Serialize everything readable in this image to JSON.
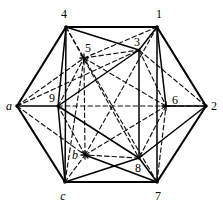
{
  "figure": {
    "background_color": "#ffffff",
    "line_color": "#000000",
    "outer_edge_width": 2.0,
    "inner_edge_width": 1.4,
    "hidden_edge_width": 1.2,
    "hidden_dash_pattern": "5,3"
  },
  "vertices": {
    "outer": [
      {
        "id": "4",
        "label": "4",
        "italic": false,
        "x": 66,
        "y": 27,
        "label_x": 64,
        "label_y": 14
      },
      {
        "id": "1",
        "label": "1",
        "italic": false,
        "x": 157,
        "y": 27,
        "label_x": 159,
        "label_y": 14
      },
      {
        "id": "2",
        "label": "2",
        "italic": false,
        "x": 206,
        "y": 106,
        "label_x": 214,
        "label_y": 106
      },
      {
        "id": "7",
        "label": "7",
        "italic": false,
        "x": 157,
        "y": 182,
        "label_x": 158,
        "label_y": 196
      },
      {
        "id": "c",
        "label": "c",
        "italic": true,
        "x": 65,
        "y": 182,
        "label_x": 63,
        "label_y": 196
      },
      {
        "id": "a",
        "label": "a",
        "italic": true,
        "x": 17,
        "y": 106,
        "label_x": 9,
        "label_y": 106
      }
    ],
    "inner": [
      {
        "id": "5",
        "label": "5",
        "italic": false,
        "x": 84,
        "y": 58,
        "label_x": 87,
        "label_y": 50,
        "marker": "cross"
      },
      {
        "id": "3",
        "label": "3",
        "italic": false,
        "x": 139,
        "y": 50,
        "label_x": 137,
        "label_y": 43,
        "marker": "none"
      },
      {
        "id": "6",
        "label": "6",
        "italic": false,
        "x": 166,
        "y": 106,
        "label_x": 174,
        "label_y": 100,
        "marker": "cross"
      },
      {
        "id": "8",
        "label": "8",
        "italic": false,
        "x": 139,
        "y": 158,
        "label_x": 137,
        "label_y": 167,
        "marker": "none"
      },
      {
        "id": "b",
        "label": "b",
        "italic": true,
        "x": 85,
        "y": 155,
        "label_x": 76,
        "label_y": 155,
        "marker": "cross"
      },
      {
        "id": "9",
        "label": "9",
        "italic": false,
        "x": 58,
        "y": 106,
        "label_x": 52,
        "label_y": 99,
        "marker": "none"
      }
    ]
  },
  "edges": {
    "outer_hexagon": [
      {
        "from": "4",
        "to": "1",
        "style": "solid"
      },
      {
        "from": "1",
        "to": "2",
        "style": "solid"
      },
      {
        "from": "2",
        "to": "7",
        "style": "solid"
      },
      {
        "from": "7",
        "to": "c",
        "style": "solid"
      },
      {
        "from": "c",
        "to": "a",
        "style": "solid"
      },
      {
        "from": "a",
        "to": "4",
        "style": "solid"
      }
    ],
    "inner_hexagon": [
      {
        "from": "5",
        "to": "3",
        "style": "dashed"
      },
      {
        "from": "3",
        "to": "6",
        "style": "dashed"
      },
      {
        "from": "6",
        "to": "8",
        "style": "dashed"
      },
      {
        "from": "8",
        "to": "b",
        "style": "dashed"
      },
      {
        "from": "b",
        "to": "9",
        "style": "dashed"
      },
      {
        "from": "9",
        "to": "5",
        "style": "dashed"
      }
    ],
    "triangle_solid_1": [
      {
        "from": "3",
        "to": "9",
        "style": "solid"
      },
      {
        "from": "9",
        "to": "8",
        "style": "solid"
      },
      {
        "from": "8",
        "to": "3",
        "style": "solid"
      }
    ],
    "triangle_dashed_1": [
      {
        "from": "5",
        "to": "6",
        "style": "dashed"
      },
      {
        "from": "6",
        "to": "b",
        "style": "dashed"
      },
      {
        "from": "b",
        "to": "5",
        "style": "dashed"
      }
    ],
    "spokes_solid": [
      {
        "from": "4",
        "to": "3",
        "style": "solid"
      },
      {
        "from": "4",
        "to": "9",
        "style": "solid"
      },
      {
        "from": "1",
        "to": "3",
        "style": "solid"
      },
      {
        "from": "1",
        "to": "6",
        "style": "solid"
      },
      {
        "from": "2",
        "to": "6",
        "style": "solid"
      },
      {
        "from": "2",
        "to": "8",
        "style": "solid"
      },
      {
        "from": "7",
        "to": "8",
        "style": "solid"
      },
      {
        "from": "7",
        "to": "b",
        "style": "solid"
      },
      {
        "from": "c",
        "to": "b",
        "style": "solid"
      },
      {
        "from": "c",
        "to": "9",
        "style": "solid"
      },
      {
        "from": "a",
        "to": "9",
        "style": "solid"
      }
    ],
    "spokes_dashed": [
      {
        "from": "4",
        "to": "5",
        "style": "dashed"
      },
      {
        "from": "1",
        "to": "5",
        "style": "dashed"
      },
      {
        "from": "2",
        "to": "6",
        "style": "dashed"
      },
      {
        "from": "7",
        "to": "6",
        "style": "dashed"
      },
      {
        "from": "c",
        "to": "b",
        "style": "dashed"
      },
      {
        "from": "a",
        "to": "5",
        "style": "dashed"
      },
      {
        "from": "a",
        "to": "b",
        "style": "dashed"
      }
    ],
    "long_solid": [
      {
        "from": "4",
        "to": "c",
        "style": "solid"
      },
      {
        "from": "1",
        "to": "7",
        "style": "solid"
      }
    ],
    "long_dashed": [
      {
        "from": "4",
        "to": "8",
        "style": "dashed"
      },
      {
        "from": "1",
        "to": "b",
        "style": "dashed"
      },
      {
        "from": "c",
        "to": "5",
        "style": "dashed"
      },
      {
        "from": "7",
        "to": "5",
        "style": "dashed"
      },
      {
        "from": "a",
        "to": "3",
        "style": "dashed"
      },
      {
        "from": "2",
        "to": "3",
        "style": "dashed"
      }
    ]
  },
  "markers": {
    "cross_size": 4,
    "cross_ids": [
      "5",
      "6",
      "b"
    ]
  }
}
